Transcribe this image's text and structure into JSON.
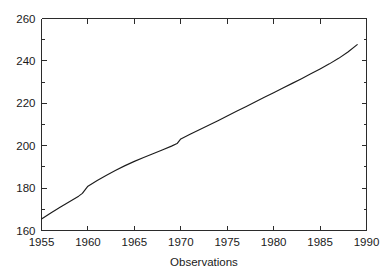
{
  "chart_data": {
    "type": "line",
    "title": "",
    "subtitle": "",
    "xlabel": "Observations",
    "ylabel": "",
    "xlim": [
      1955,
      1990
    ],
    "ylim": [
      160,
      260
    ],
    "grid": false,
    "legend": false,
    "legend_position": "none",
    "x_ticks": [
      1955,
      1960,
      1965,
      1970,
      1975,
      1980,
      1985,
      1990
    ],
    "x_tick_labels": [
      "1955",
      "1960",
      "1965",
      "1970",
      "1975",
      "1980",
      "1985",
      "1990"
    ],
    "y_ticks": [
      160,
      180,
      200,
      220,
      240,
      260
    ],
    "y_tick_labels": [
      "160",
      "180",
      "200",
      "220",
      "240",
      "260"
    ],
    "y_minor_ticks": [
      170,
      190,
      210,
      230,
      250
    ],
    "line_color": "#1c1c1c",
    "axis_color": "#2b2b2b",
    "background_color": "#ffffff",
    "series": [
      {
        "name": "observations",
        "x": [
          1955,
          1956,
          1957,
          1958,
          1959,
          1959.4,
          1960,
          1961,
          1962,
          1963,
          1964,
          1965,
          1966,
          1967,
          1968,
          1969,
          1969.6,
          1970,
          1971,
          1972,
          1973,
          1974,
          1975,
          1976,
          1977,
          1978,
          1979,
          1980,
          1981,
          1982,
          1983,
          1984,
          1985,
          1986,
          1987,
          1988,
          1989
        ],
        "y": [
          165.4,
          168.3,
          171.0,
          173.6,
          176.2,
          177.5,
          180.9,
          183.6,
          186.1,
          188.4,
          190.6,
          192.6,
          194.4,
          196.2,
          198.0,
          199.8,
          201.0,
          203.2,
          205.4,
          207.5,
          209.6,
          211.8,
          214.0,
          216.2,
          218.4,
          220.6,
          222.8,
          225.0,
          227.2,
          229.4,
          231.6,
          233.9,
          236.2,
          238.6,
          241.2,
          244.2,
          247.7
        ]
      }
    ],
    "annotations": []
  },
  "figure": {
    "name": "line-plot",
    "xlabel_text": "Observations"
  }
}
